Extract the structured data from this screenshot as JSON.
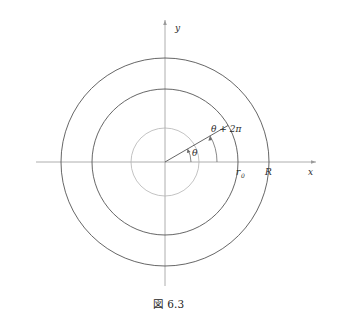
{
  "figure": {
    "caption": "図 6.3",
    "axes": {
      "x_label": "x",
      "y_label": "y",
      "x_axis_name": "x-axis",
      "y_axis_name": "y-axis",
      "origin": {
        "x": 165,
        "y": 162
      }
    },
    "circles": [
      {
        "name": "outer-radius-R",
        "radius": 104,
        "label": "R",
        "stroke": "#555555"
      },
      {
        "name": "radius-r0",
        "radius": 73,
        "label": "r_0",
        "stroke": "#555555"
      },
      {
        "name": "inner-small-circle",
        "radius": 34,
        "label": "",
        "stroke": "#b4b4b4"
      }
    ],
    "radius_labels": {
      "r0": "r",
      "r0_subscript": "0",
      "R": "R"
    },
    "angles": [
      {
        "name": "theta",
        "label": "θ",
        "arc_radius": 26,
        "degrees": 30
      },
      {
        "name": "theta-plus-two-pi",
        "label": "θ + 2π",
        "arc_radius": 52,
        "degrees": 30
      }
    ],
    "ray": {
      "name": "radial-ray",
      "from": {
        "x": 165,
        "y": 162
      },
      "to": {
        "x": 228,
        "y": 114
      }
    },
    "colors": {
      "background": "#ffffff",
      "axis": "#9a9a9a",
      "circle_dark": "#555555",
      "circle_light": "#b4b4b4",
      "text": "#2b2b2b"
    }
  }
}
